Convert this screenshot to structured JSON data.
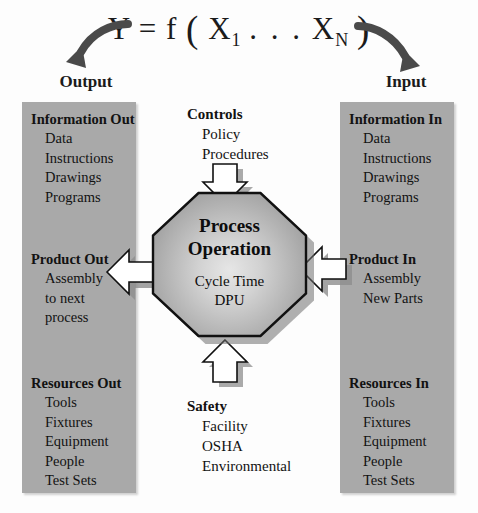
{
  "formula": {
    "y": "Y",
    "equals": "=",
    "f": "f",
    "open_paren": "(",
    "x1": "X",
    "x1_sub": "1",
    "dots": ". . .",
    "xn": "X",
    "xn_sub": "N",
    "close_paren": ")"
  },
  "labels": {
    "output": "Output",
    "input": "Input"
  },
  "output_column": {
    "information": {
      "heading": "Information Out",
      "items": [
        "Data",
        "Instructions",
        "Drawings",
        "Programs"
      ]
    },
    "product": {
      "heading": "Product Out",
      "items": [
        "Assembly",
        "to next",
        "process"
      ]
    },
    "resources": {
      "heading": "Resources  Out",
      "items": [
        "Tools",
        "Fixtures",
        "Equipment",
        "People",
        "Test Sets"
      ]
    }
  },
  "input_column": {
    "information": {
      "heading": "Information In",
      "items": [
        "Data",
        "Instructions",
        "Drawings",
        "Programs"
      ]
    },
    "product": {
      "heading": "Product In",
      "items": [
        "Assembly",
        "New Parts"
      ]
    },
    "resources": {
      "heading": "Resources In",
      "items": [
        "Tools",
        "Fixtures",
        "Equipment",
        "People",
        "Test Sets"
      ]
    }
  },
  "controls": {
    "heading": "Controls",
    "items": [
      "Policy",
      "Procedures"
    ]
  },
  "safety": {
    "heading": "Safety",
    "items": [
      "Facility",
      "OSHA",
      "Environmental"
    ]
  },
  "process": {
    "title_line1": "Process",
    "title_line2": "Operation",
    "metric1": "Cycle Time",
    "metric2": "DPU"
  },
  "colors": {
    "column_gray": "#a9a9a9",
    "octagon_mid": "#b4b4b4",
    "shadow_gray": "#6f6f6f",
    "text": "#121212",
    "arrow_fill": "#ffffff",
    "arrow_stroke": "#111111"
  }
}
